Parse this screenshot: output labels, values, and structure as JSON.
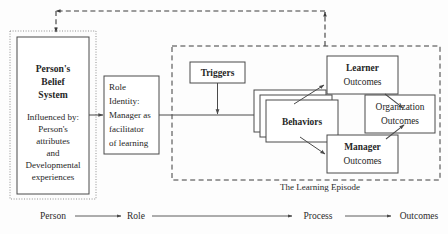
{
  "figure": {
    "caption": "The Learning Episode",
    "background_color": "#fdfdfd",
    "line_color": "#4a4a4a"
  },
  "person_block": {
    "title_line_1": "Person's",
    "title_line_2": "Belief",
    "title_line_3": "System",
    "body_line_1": "Influenced by:",
    "body_line_2": "Person's",
    "body_line_3": "attributes",
    "body_line_4": "and",
    "body_line_5": "Developmental",
    "body_line_6": "experiences"
  },
  "role_block": {
    "line_1": "Role",
    "line_2": "Identity:",
    "line_3": "Manager as",
    "line_4": "facilitator",
    "line_5": "of learning"
  },
  "process_block": {
    "triggers": "Triggers",
    "behaviors": "Behaviors"
  },
  "outcome_blocks": {
    "learner_line_1": "Learner",
    "learner_line_2": "Outcomes",
    "organization_line_1": "Organization",
    "organization_line_2": "Outcomes",
    "manager_line_1": "Manager",
    "manager_line_2": "Outcomes"
  },
  "axis": {
    "stage_1": "Person",
    "stage_2": "Role",
    "stage_3": "Process",
    "stage_4": "Outcomes"
  }
}
